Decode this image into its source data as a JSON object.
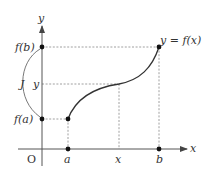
{
  "diagram": {
    "type": "function-graph",
    "axes": {
      "x_label": "x",
      "y_label": "y",
      "origin_label": "O"
    },
    "x_ticks": [
      {
        "label": "a",
        "px": 68
      },
      {
        "label": "x",
        "px": 119
      },
      {
        "label": "b",
        "px": 159
      }
    ],
    "y_ticks": [
      {
        "label": "f(b)",
        "py": 47
      },
      {
        "label": "y",
        "py": 84
      },
      {
        "label": "f(a)",
        "py": 119
      }
    ],
    "interval_label": "J",
    "curve_label": "y = f(x)",
    "points": [
      {
        "name": "A",
        "coords": "(a, f(a))"
      },
      {
        "name": "B",
        "coords": "(b, f(b))"
      }
    ],
    "colors": {
      "axis": "#666666",
      "curve": "#333333",
      "dashed": "#888888",
      "text": "#333333",
      "point": "#111111"
    }
  }
}
